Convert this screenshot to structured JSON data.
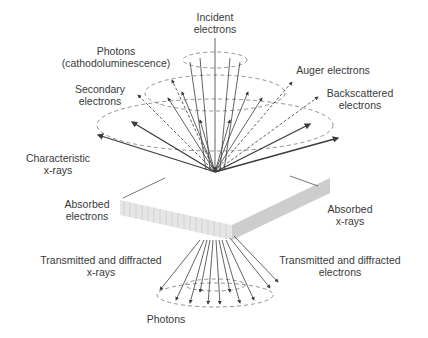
{
  "diagram": {
    "colors": {
      "line": "#3c3c3c",
      "dashed": "#777777",
      "slab_top": "#ffffff",
      "slab_front": "#e4e4e4",
      "slab_side": "#cfcfcf",
      "text": "#3a3a3a"
    },
    "labels": {
      "incident": {
        "line1": "Incident",
        "line2": "electrons"
      },
      "photons_cl": {
        "line1": "Photons",
        "line2": "(cathodoluminescence)"
      },
      "auger": {
        "line1": "Auger electrons"
      },
      "secondary": {
        "line1": "Secondary",
        "line2": "electrons"
      },
      "backscattered": {
        "line1": "Backscattered",
        "line2": "electrons"
      },
      "characteristic": {
        "line1": "Characteristic",
        "line2": "x-rays"
      },
      "absorbed_e": {
        "line1": "Absorbed",
        "line2": "electrons"
      },
      "absorbed_x": {
        "line1": "Absorbed",
        "line2": "x-rays"
      },
      "trans_x": {
        "line1": "Transmitted and diffracted",
        "line2": "x-rays"
      },
      "trans_e": {
        "line1": "Transmitted and diffracted",
        "line2": "electrons"
      },
      "photons_bottom": {
        "line1": "Photons"
      }
    }
  }
}
